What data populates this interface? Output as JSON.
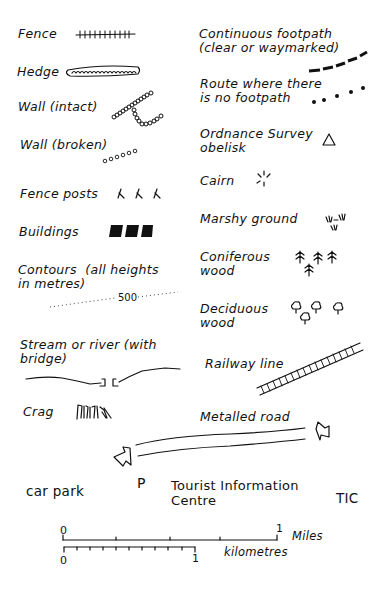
{
  "legend": {
    "left": [
      {
        "id": "fence",
        "label": "Fence",
        "symbol": "fence-line-icon"
      },
      {
        "id": "hedge",
        "label": "Hedge",
        "symbol": "hedge-line-icon"
      },
      {
        "id": "wall_intact",
        "label": "Wall (intact)",
        "symbol": "wall-intact-icon"
      },
      {
        "id": "wall_broken",
        "label": "Wall (broken)",
        "symbol": "wall-broken-icon"
      },
      {
        "id": "fence_posts",
        "label": "Fence posts",
        "symbol": "fence-posts-icon"
      },
      {
        "id": "buildings",
        "label": "Buildings",
        "symbol": "buildings-icon"
      },
      {
        "id": "contours",
        "label": "Contours  (all heights\nin metres)",
        "symbol": "contour-line-icon",
        "contour_value": "500"
      },
      {
        "id": "stream",
        "label": "Stream or river (with\nbridge)",
        "symbol": "stream-bridge-icon"
      },
      {
        "id": "crag",
        "label": "Crag",
        "symbol": "crag-icon"
      }
    ],
    "right": [
      {
        "id": "continuous_footpath",
        "label": "Continuous footpath\n(clear or waymarked)",
        "symbol": "dashed-path-icon"
      },
      {
        "id": "route_no_footpath",
        "label": "Route where there\nis no footpath",
        "symbol": "dotted-path-icon"
      },
      {
        "id": "os_obelisk",
        "label": "Ordnance Survey\nobelisk",
        "symbol": "triangle-icon"
      },
      {
        "id": "cairn",
        "label": "Cairn",
        "symbol": "cairn-icon"
      },
      {
        "id": "marshy_ground",
        "label": "Marshy ground",
        "symbol": "marsh-icon"
      },
      {
        "id": "coniferous_wood",
        "label": "Coniferous\nwood",
        "symbol": "conifer-tree-icon"
      },
      {
        "id": "deciduous_wood",
        "label": "Deciduous\nwood",
        "symbol": "deciduous-tree-icon"
      },
      {
        "id": "railway",
        "label": "Railway line",
        "symbol": "railway-icon"
      },
      {
        "id": "metalled_road",
        "label": "Metalled road",
        "symbol": "road-arrows-icon"
      }
    ],
    "bottom": {
      "car_park": {
        "label": "car park",
        "symbol": "P"
      },
      "tic": {
        "label": "Tourist Information\nCentre",
        "symbol": "TIC"
      }
    },
    "scale": {
      "miles": {
        "start": "0",
        "end": "1",
        "unit": "Miles",
        "ticks": 4
      },
      "kilometres": {
        "start": "0",
        "end": "1",
        "unit": "kilometres",
        "ticks": 10
      }
    }
  }
}
